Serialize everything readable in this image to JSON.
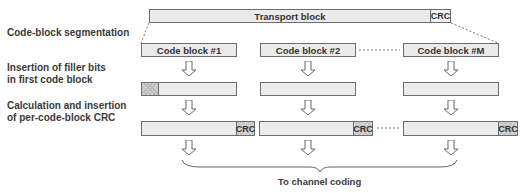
{
  "diagram": {
    "steps": [
      {
        "label": "Code-block segmentation"
      },
      {
        "label_line1": "Insertion of filler bits",
        "label_line2": "in first code block"
      },
      {
        "label_line1": "Calculation and insertion",
        "label_line2": "of per-code-block CRC"
      }
    ],
    "transport_block": {
      "label": "Transport block",
      "crc_label": "CRC"
    },
    "code_blocks": [
      {
        "label": "Code block #1"
      },
      {
        "label": "Code block #2"
      },
      {
        "label": "Code block #M"
      }
    ],
    "crc_label": "CRC",
    "output_label": "To channel coding",
    "colors": {
      "box_fill": "#ebebeb",
      "box_border": "#6d6d6d",
      "text": "#333333"
    }
  }
}
